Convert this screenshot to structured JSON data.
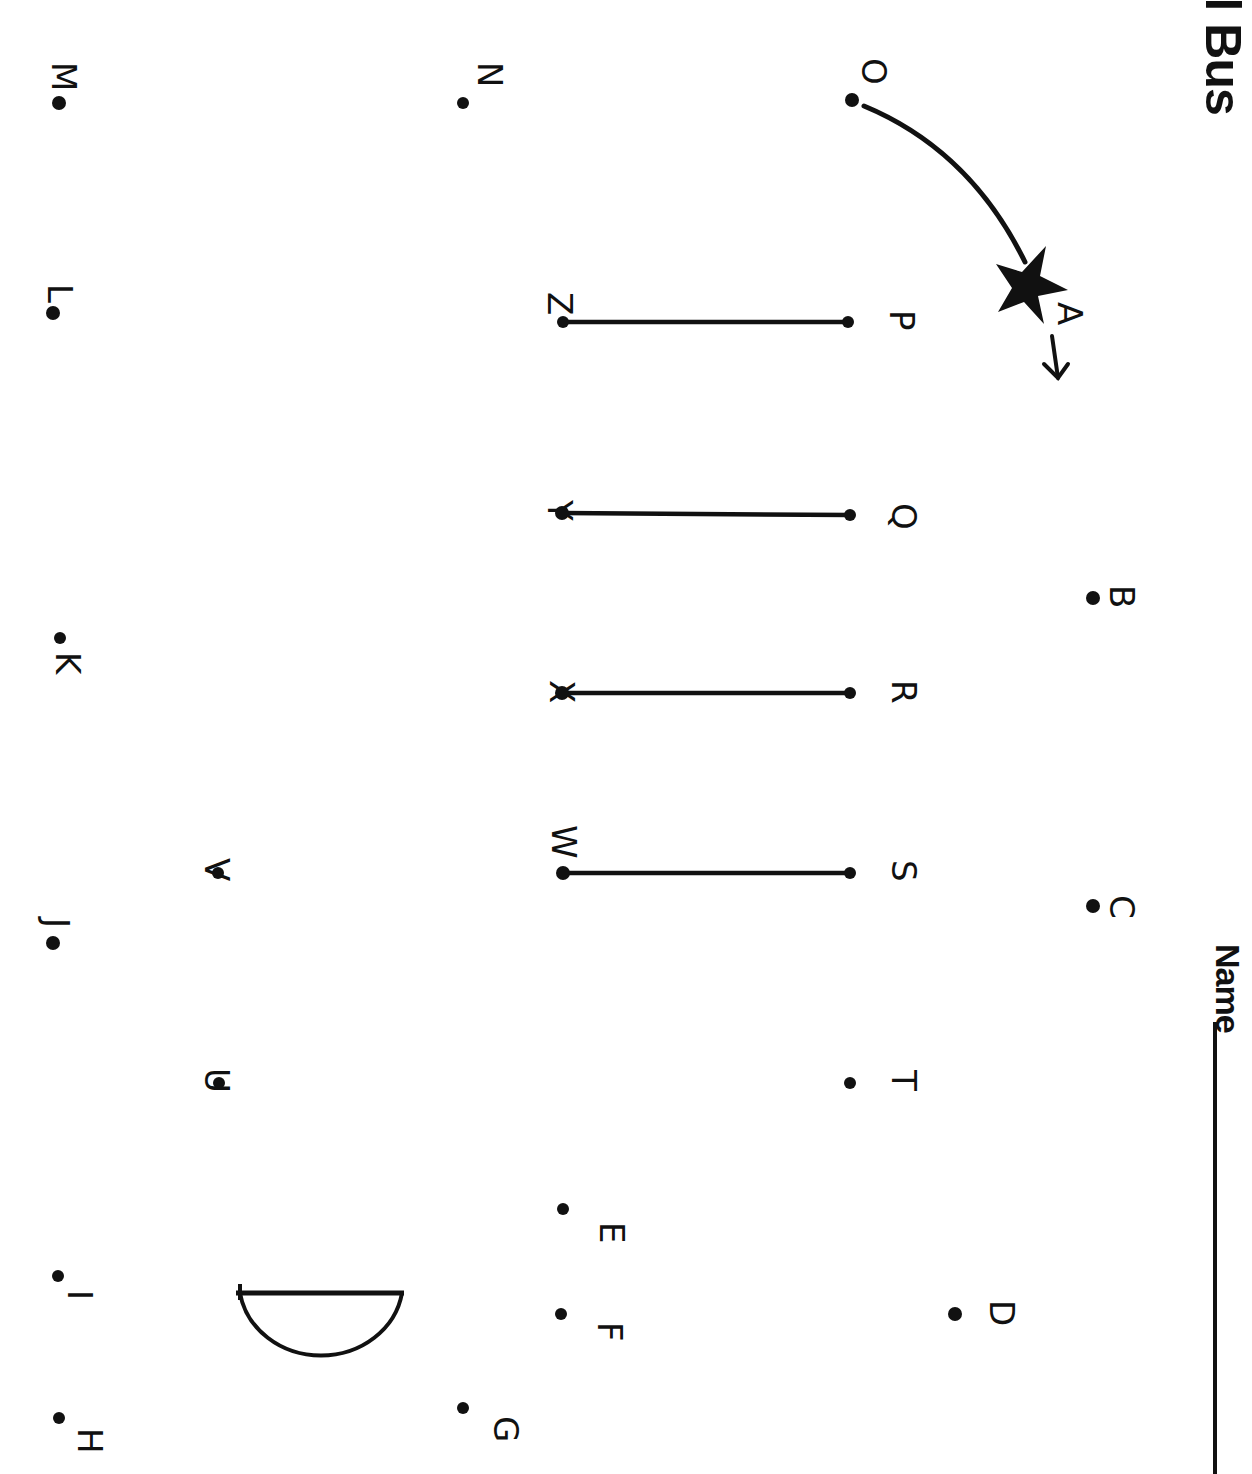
{
  "worksheet": {
    "title_fragment": "ol Bus",
    "name_label": "Name",
    "orientation": "rotated 90° clockwise",
    "ink_color": "#111111",
    "paper_color": "#ffffff"
  },
  "dots": [
    {
      "letter": "A",
      "x": 1030,
      "y": 282,
      "start": true
    },
    {
      "letter": "B",
      "x": 1093,
      "y": 598
    },
    {
      "letter": "C",
      "x": 1093,
      "y": 906
    },
    {
      "letter": "D",
      "x": 955,
      "y": 1314
    },
    {
      "letter": "E",
      "x": 563,
      "y": 1209
    },
    {
      "letter": "F",
      "x": 561,
      "y": 1314
    },
    {
      "letter": "G",
      "x": 463,
      "y": 1408
    },
    {
      "letter": "H",
      "x": 59,
      "y": 1418
    },
    {
      "letter": "I",
      "x": 58,
      "y": 1276
    },
    {
      "letter": "J",
      "x": 53,
      "y": 943
    },
    {
      "letter": "K",
      "x": 60,
      "y": 638
    },
    {
      "letter": "L",
      "x": 53,
      "y": 313
    },
    {
      "letter": "M",
      "x": 59,
      "y": 103
    },
    {
      "letter": "N",
      "x": 463,
      "y": 103
    },
    {
      "letter": "O",
      "x": 852,
      "y": 100
    },
    {
      "letter": "P",
      "x": 848,
      "y": 322
    },
    {
      "letter": "Q",
      "x": 850,
      "y": 515
    },
    {
      "letter": "R",
      "x": 850,
      "y": 693
    },
    {
      "letter": "S",
      "x": 850,
      "y": 873
    },
    {
      "letter": "T",
      "x": 850,
      "y": 1083
    },
    {
      "letter": "U",
      "x": 219,
      "y": 1083
    },
    {
      "letter": "V",
      "x": 218,
      "y": 873
    },
    {
      "letter": "W",
      "x": 563,
      "y": 873
    },
    {
      "letter": "X",
      "x": 562,
      "y": 693
    },
    {
      "letter": "Y",
      "x": 562,
      "y": 513
    },
    {
      "letter": "Z",
      "x": 563,
      "y": 322
    }
  ],
  "connected_lines": [
    {
      "from": "P",
      "to": "Z"
    },
    {
      "from": "Q",
      "to": "Y"
    },
    {
      "from": "R",
      "to": "X"
    },
    {
      "from": "S",
      "to": "W"
    }
  ],
  "start_marker": {
    "shape": "star",
    "at": "A",
    "arrow_from": "O",
    "direction_arrow": "→"
  },
  "drawn_shapes": [
    {
      "type": "half-circle",
      "label": "wheel"
    }
  ]
}
